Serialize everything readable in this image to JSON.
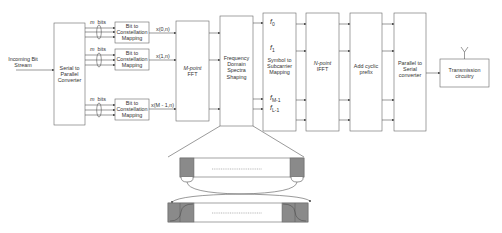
{
  "diagram": {
    "input_label": [
      "Incoming Bit",
      "Stream"
    ],
    "blocks": {
      "serial_to_parallel": [
        "Serial to",
        "Parallel",
        "Converter"
      ],
      "bit_mapping": [
        "Bit to",
        "Constellation",
        "Mapping"
      ],
      "mpoint_fft": [
        "M-point",
        "FFT"
      ],
      "freq_shaping": [
        "Frequency",
        "Domain",
        "Spectra",
        "Shaping"
      ],
      "symbol_mapping": [
        "Symbol to",
        "Subcarrier",
        "Mapping"
      ],
      "npoint_ifft": [
        "N-point",
        "IFFT"
      ],
      "cyclic_prefix": [
        "Add cyclic",
        "prefix"
      ],
      "parallel_to_serial": [
        "Parallel to",
        "Serial",
        "converter"
      ],
      "transmission": [
        "Transmission",
        "circuitry"
      ]
    },
    "bits_label": "m bits",
    "bits_m": "m",
    "bits_word": "bits",
    "fft_inputs": [
      "x(0,n)",
      "x(1,n)",
      "x(M - 1,n)"
    ],
    "subcarrier_labels": [
      "f0",
      "f1",
      "fM-1",
      "fL-1"
    ],
    "subcarrier_parts": {
      "f0": {
        "base": "f",
        "sub": "0"
      },
      "f1": {
        "base": "f",
        "sub": "1"
      },
      "fM1": {
        "base": "f",
        "sub": "M-1"
      },
      "fL1": {
        "base": "f",
        "sub": "L-1"
      }
    },
    "colors": {
      "line": "#555555",
      "shade": "#8a8a8a",
      "box_border": "#666666"
    }
  }
}
